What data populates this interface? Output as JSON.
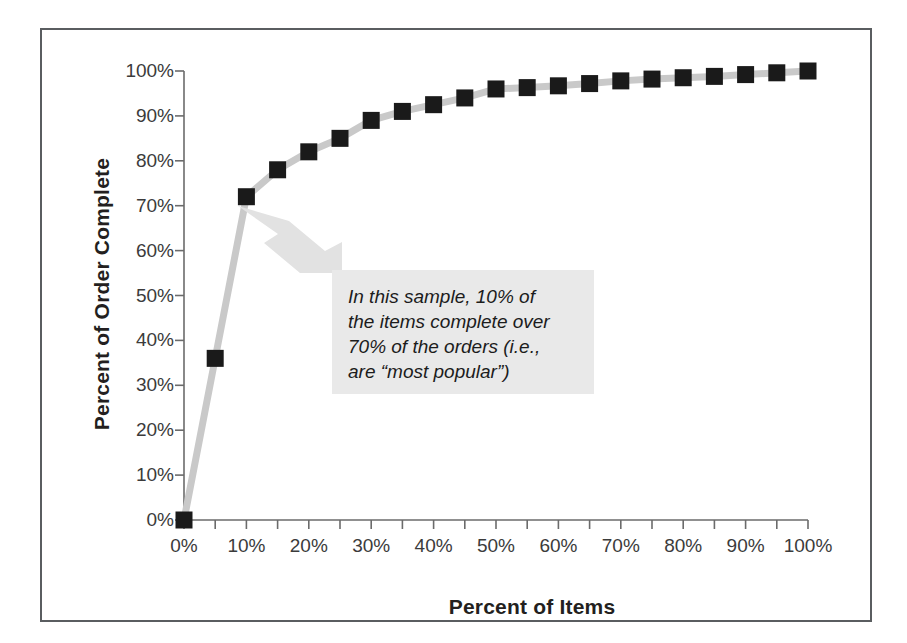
{
  "chart_data": {
    "type": "line",
    "title": "",
    "subtitle": "",
    "xlabel": "Percent of Items",
    "ylabel": "Percent of Order Complete",
    "xlim": [
      0,
      100
    ],
    "ylim": [
      0,
      100
    ],
    "grid": false,
    "legend": "none",
    "marker": "filled-square",
    "marker_color": "#1a1a1a",
    "line_color": "#c9c9c9",
    "x": [
      0,
      5,
      10,
      15,
      20,
      25,
      30,
      35,
      40,
      45,
      50,
      55,
      60,
      65,
      70,
      75,
      80,
      85,
      90,
      95,
      100
    ],
    "values": [
      0,
      36,
      72,
      78,
      82,
      85,
      89,
      91,
      92.5,
      94,
      96,
      96.3,
      96.7,
      97.2,
      97.8,
      98.2,
      98.5,
      98.8,
      99.2,
      99.6,
      100
    ],
    "series": [
      {
        "name": "Cumulative percent of order complete",
        "values": [
          0,
          36,
          72,
          78,
          82,
          85,
          89,
          91,
          92.5,
          94,
          96,
          96.3,
          96.7,
          97.2,
          97.8,
          98.2,
          98.5,
          98.8,
          99.2,
          99.6,
          100
        ]
      }
    ],
    "x_tick_labels": [
      "0%",
      "10%",
      "20%",
      "30%",
      "40%",
      "50%",
      "60%",
      "70%",
      "80%",
      "90%",
      "100%"
    ],
    "x_tick_label_values": [
      0,
      10,
      20,
      30,
      40,
      50,
      60,
      70,
      80,
      90,
      100
    ],
    "x_minor_ticks": [
      0,
      5,
      10,
      15,
      20,
      25,
      30,
      35,
      40,
      45,
      50,
      55,
      60,
      65,
      70,
      75,
      80,
      85,
      90,
      95,
      100
    ],
    "y_tick_labels": [
      "0%",
      "10%",
      "20%",
      "30%",
      "40%",
      "50%",
      "60%",
      "70%",
      "80%",
      "90%",
      "100%"
    ],
    "y_tick_label_values": [
      0,
      10,
      20,
      30,
      40,
      50,
      60,
      70,
      80,
      90,
      100
    ],
    "annotations": [
      {
        "name": "callout",
        "text": "In this sample, 10% of\nthe items complete over\n70% of the orders (i.e.,\nare “most popular”)",
        "points_to_x": 10,
        "points_to_y": 72,
        "background": "#e9e9e9",
        "arrow_color": "#e2e2e2"
      }
    ]
  },
  "colors": {
    "frame_border": "#5a5d60",
    "axis": "#6b6b6b",
    "marker": "#1a1a1a",
    "line": "#c9c9c9",
    "callout_bg": "#e9e9e9",
    "text": "#231f20"
  }
}
